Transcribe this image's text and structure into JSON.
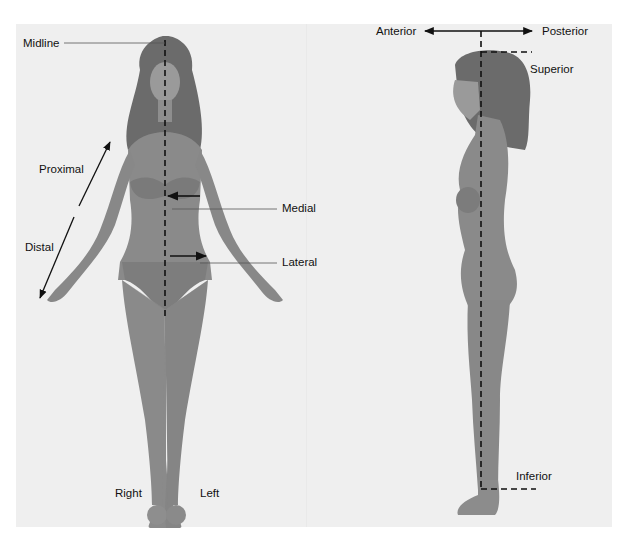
{
  "diagram": {
    "front_view": {
      "labels": {
        "midline": "Midline",
        "proximal": "Proximal",
        "distal": "Distal",
        "medial": "Medial",
        "lateral": "Lateral",
        "right": "Right",
        "left": "Left"
      }
    },
    "side_view": {
      "labels": {
        "anterior": "Anterior",
        "posterior": "Posterior",
        "superior": "Superior",
        "inferior": "Inferior"
      }
    },
    "colors": {
      "background": "#efefef",
      "figure": "#8a8a8a",
      "hair": "#6b6b6b",
      "line": "#111111"
    }
  }
}
